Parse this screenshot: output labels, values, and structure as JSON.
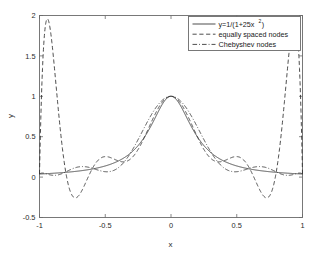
{
  "chart_data": {
    "type": "line",
    "title": "",
    "xlabel": "x",
    "ylabel": "y",
    "xlim": [
      -1,
      1
    ],
    "ylim": [
      -0.5,
      2
    ],
    "xticks": [
      -1,
      -0.5,
      0,
      0.5,
      1
    ],
    "xticklabels": [
      "-1",
      "-0.5",
      "0",
      "0.5",
      "1"
    ],
    "yticks": [
      -0.5,
      0,
      0.5,
      1,
      1.5,
      2
    ],
    "yticklabels": [
      "-0.5",
      "0",
      "0.5",
      "1",
      "1.5",
      "2"
    ],
    "grid": false,
    "legend_position": "upper right",
    "series": [
      {
        "name": "y=1/(1+25x²)",
        "name_base": "y=1/(1+25x",
        "name_sup": "2",
        "name_tail": ")",
        "style": "solid",
        "kind": "runge",
        "color": "#2e2e2e"
      },
      {
        "name": "equally spaced nodes",
        "style": "dashed",
        "kind": "equispaced-interp",
        "degree": 10,
        "color": "#2e2e2e"
      },
      {
        "name": "Chebyshev nodes",
        "style": "dashdot",
        "kind": "chebyshev-interp",
        "degree": 10,
        "color": "#2e2e2e"
      }
    ],
    "annotations": {
      "peak_value": 1,
      "equispaced_max_overshoot": 1.95,
      "equispaced_min_undershoot": -0.27
    }
  },
  "axes": {
    "x_label": "x",
    "y_label": "y"
  },
  "legend": {
    "entries": [
      {
        "label_base": "y=1/(1+25x",
        "label_sup": "2",
        "label_tail": ")",
        "style": "solid"
      },
      {
        "label_base": "equally spaced nodes",
        "label_sup": "",
        "label_tail": "",
        "style": "dashed"
      },
      {
        "label_base": "Chebyshev nodes",
        "label_sup": "",
        "label_tail": "",
        "style": "dashdot"
      }
    ]
  }
}
